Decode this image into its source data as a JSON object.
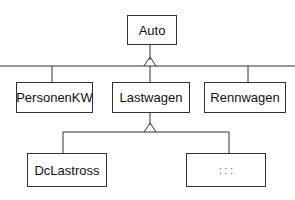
{
  "diagram": {
    "type": "inheritance-hierarchy",
    "root": {
      "label": "Auto"
    },
    "level1": [
      {
        "label": "PersonenKW"
      },
      {
        "label": "Lastwagen"
      },
      {
        "label": "Rennwagen"
      }
    ],
    "level2": [
      {
        "label": "DcLastross"
      },
      {
        "label": ": : :"
      }
    ],
    "edges": [
      {
        "from": "PersonenKW",
        "to": "Auto"
      },
      {
        "from": "Lastwagen",
        "to": "Auto"
      },
      {
        "from": "Rennwagen",
        "to": "Auto"
      },
      {
        "from": "DcLastross",
        "to": "Lastwagen"
      },
      {
        "from": ": : :",
        "to": "Lastwagen"
      }
    ],
    "colors": {
      "line": "#333333",
      "background": "#ffffff",
      "text": "#111111"
    }
  }
}
